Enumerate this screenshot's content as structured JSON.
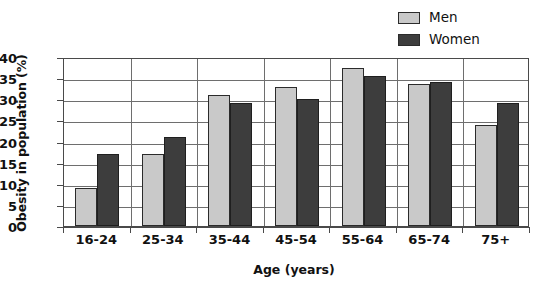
{
  "chart_data": {
    "type": "bar",
    "title": "",
    "xlabel": "Age (years)",
    "ylabel": "Obesity in population (%)",
    "categories": [
      "16-24",
      "25-34",
      "35-44",
      "45-54",
      "55-64",
      "65-74",
      "75+"
    ],
    "series": [
      {
        "name": "Men",
        "color": "#c9c9c9",
        "values": [
          9,
          17,
          31,
          33,
          37.5,
          33.5,
          24
        ]
      },
      {
        "name": "Women",
        "color": "#3d3d3d",
        "values": [
          17,
          21,
          29,
          30,
          35.5,
          34,
          29
        ]
      }
    ],
    "ylim": [
      0,
      40
    ],
    "yticks": [
      0,
      5,
      10,
      15,
      20,
      25,
      30,
      35,
      40
    ],
    "ytick_labels": [
      "0",
      "5",
      "10",
      "15",
      "20",
      "25",
      "30",
      "35",
      "40"
    ],
    "grid": "horizontal-and-category-separators",
    "legend_position": "top-right",
    "legend": [
      {
        "label": "Men",
        "swatch": "light-gray"
      },
      {
        "label": "Women",
        "swatch": "dark-gray"
      }
    ]
  }
}
